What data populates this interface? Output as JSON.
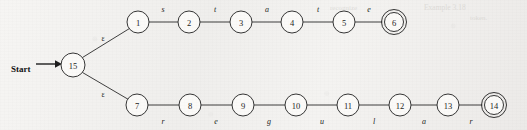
{
  "figure": {
    "kind": "nfa-state-diagram",
    "start_label": "Start",
    "background_color": "#f4f3f1",
    "ink_color": "#2b2b2b",
    "epsilon_symbol": "ε"
  },
  "states": {
    "start": {
      "id": "15",
      "label": "15",
      "cx": 73,
      "cy": 65,
      "r": 12,
      "accepting": false
    },
    "top": [
      {
        "id": "1",
        "label": "1",
        "cx": 138,
        "cy": 22,
        "r": 11,
        "accepting": false
      },
      {
        "id": "2",
        "label": "2",
        "cx": 189,
        "cy": 22,
        "r": 11,
        "accepting": false
      },
      {
        "id": "3",
        "label": "3",
        "cx": 241,
        "cy": 22,
        "r": 11,
        "accepting": false
      },
      {
        "id": "4",
        "label": "4",
        "cx": 292,
        "cy": 22,
        "r": 11,
        "accepting": false
      },
      {
        "id": "5",
        "label": "5",
        "cx": 344,
        "cy": 22,
        "r": 11,
        "accepting": false
      },
      {
        "id": "6",
        "label": "6",
        "cx": 394,
        "cy": 22,
        "r": 9.5,
        "accepting": true
      }
    ],
    "bottom": [
      {
        "id": "7",
        "label": "7",
        "cx": 137,
        "cy": 105,
        "r": 11,
        "accepting": false
      },
      {
        "id": "8",
        "label": "8",
        "cx": 190,
        "cy": 105,
        "r": 11,
        "accepting": false
      },
      {
        "id": "9",
        "label": "9",
        "cx": 243,
        "cy": 105,
        "r": 11,
        "accepting": false
      },
      {
        "id": "10",
        "label": "10",
        "cx": 296,
        "cy": 105,
        "r": 11,
        "accepting": false
      },
      {
        "id": "11",
        "label": "11",
        "cx": 348,
        "cy": 105,
        "r": 11,
        "accepting": false
      },
      {
        "id": "12",
        "label": "12",
        "cx": 400,
        "cy": 105,
        "r": 11,
        "accepting": false
      },
      {
        "id": "13",
        "label": "13",
        "cx": 448,
        "cy": 105,
        "r": 11,
        "accepting": false
      },
      {
        "id": "14",
        "label": "14",
        "cx": 494,
        "cy": 105,
        "r": 9.5,
        "accepting": true
      }
    ]
  },
  "transitions": {
    "epsilon_top": {
      "from": "15",
      "to": "1",
      "symbol": "ε",
      "label_x": 103,
      "label_y": 41
    },
    "epsilon_bottom": {
      "from": "15",
      "to": "7",
      "symbol": "ε",
      "label_x": 103,
      "label_y": 97
    },
    "top_chain": [
      {
        "from": "1",
        "to": "2",
        "symbol": "s",
        "label_x": 163,
        "label_y": 12
      },
      {
        "from": "2",
        "to": "3",
        "symbol": "t",
        "label_x": 215,
        "label_y": 12
      },
      {
        "from": "3",
        "to": "4",
        "symbol": "a",
        "label_x": 267,
        "label_y": 12
      },
      {
        "from": "4",
        "to": "5",
        "symbol": "t",
        "label_x": 318,
        "label_y": 12
      },
      {
        "from": "5",
        "to": "6",
        "symbol": "e",
        "label_x": 369,
        "label_y": 12
      }
    ],
    "bottom_chain": [
      {
        "from": "7",
        "to": "8",
        "symbol": "r",
        "label_x": 163,
        "label_y": 124
      },
      {
        "from": "8",
        "to": "9",
        "symbol": "e",
        "label_x": 216,
        "label_y": 124
      },
      {
        "from": "9",
        "to": "10",
        "symbol": "g",
        "label_x": 269,
        "label_y": 124
      },
      {
        "from": "10",
        "to": "11",
        "symbol": "u",
        "label_x": 322,
        "label_y": 124
      },
      {
        "from": "11",
        "to": "12",
        "symbol": "l",
        "label_x": 374,
        "label_y": 124
      },
      {
        "from": "12",
        "to": "13",
        "symbol": "a",
        "label_x": 424,
        "label_y": 124
      },
      {
        "from": "13",
        "to": "14",
        "symbol": "r",
        "label_x": 471,
        "label_y": 124
      }
    ]
  },
  "start_arrow": {
    "text": "Start",
    "text_x": 11,
    "text_y": 72,
    "line_x1": 36,
    "line_x2": 55,
    "line_y": 64,
    "head_x": 61
  },
  "bleed_through": [
    {
      "text": "Example 3.18",
      "x": 424,
      "y": 10,
      "size": 7.5
    },
    {
      "text": "token.",
      "x": 470,
      "y": 20,
      "size": 7
    },
    {
      "text": "recognize",
      "x": 330,
      "y": 10,
      "size": 7
    }
  ]
}
